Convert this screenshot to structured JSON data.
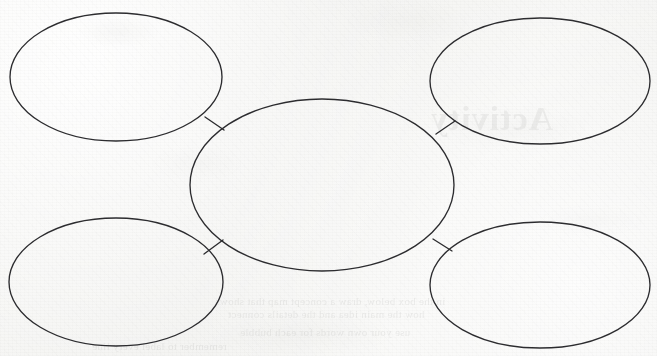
{
  "document": {
    "kind": "scanned-worksheet",
    "page_width": 657,
    "page_height": 356,
    "paper_color": "#f4f4f2",
    "ink_color": "#2c2c2f"
  },
  "diagram": {
    "type": "concept-map",
    "title": "",
    "center": {
      "id": "center-bubble",
      "label": "",
      "cx": 322,
      "cy": 185,
      "rx": 132,
      "ry": 86
    },
    "satellites": [
      {
        "id": "bubble-top-left",
        "label": "",
        "cx": 116,
        "cy": 77,
        "rx": 106,
        "ry": 64
      },
      {
        "id": "bubble-top-right",
        "label": "",
        "cx": 540,
        "cy": 81,
        "rx": 110,
        "ry": 63
      },
      {
        "id": "bubble-bottom-left",
        "label": "",
        "cx": 116,
        "cy": 282,
        "rx": 107,
        "ry": 64
      },
      {
        "id": "bubble-bottom-right",
        "label": "",
        "cx": 540,
        "cy": 285,
        "rx": 110,
        "ry": 63
      }
    ],
    "connectors": [
      {
        "id": "connector-top-left",
        "x1": 205,
        "y1": 117,
        "x2": 224,
        "y2": 130
      },
      {
        "id": "connector-top-right",
        "x1": 436,
        "y1": 134,
        "x2": 455,
        "y2": 121
      },
      {
        "id": "connector-bottom-left",
        "x1": 204,
        "y1": 254,
        "x2": 223,
        "y2": 240
      },
      {
        "id": "connector-bottom-right",
        "x1": 433,
        "y1": 239,
        "x2": 452,
        "y2": 251
      }
    ]
  },
  "bleed_through": {
    "note": "faint mirrored show-through from the reverse of the sheet; not legible",
    "marks": [
      {
        "id": "ghost-heading-1",
        "x": 430,
        "y": 118,
        "size": "heading",
        "text": "Activity"
      },
      {
        "id": "ghost-line-1",
        "x": 215,
        "y": 300,
        "size": "line",
        "text": "in the box below, draw a concept map that shows"
      },
      {
        "id": "ghost-line-2",
        "x": 228,
        "y": 313,
        "size": "line",
        "text": "how the main idea and the details connect"
      },
      {
        "id": "ghost-line-3",
        "x": 240,
        "y": 330,
        "size": "line",
        "text": "use your own words for each bubble"
      },
      {
        "id": "ghost-line-4",
        "x": 92,
        "y": 344,
        "size": "line",
        "text": "remember to label every line"
      }
    ]
  }
}
